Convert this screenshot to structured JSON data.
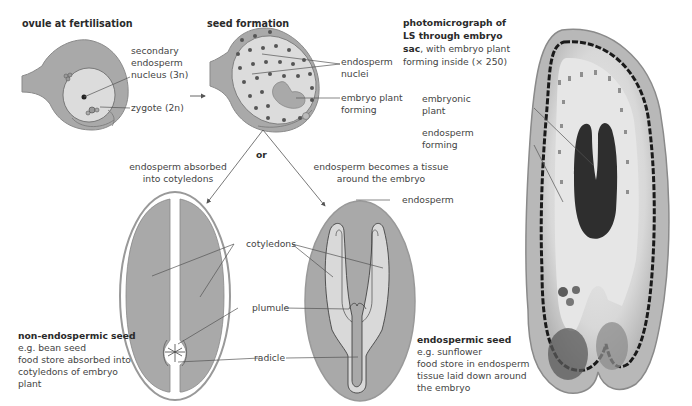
{
  "colors": {
    "seed_fill": "#a9a9a9",
    "light_fill": "#d9d9d9",
    "outline": "#8a8a8a",
    "line": "#555555",
    "text": "#444444"
  },
  "panels": {
    "ovule": {
      "title": "ovule at fertilisation",
      "labels": {
        "secondary_nucleus": [
          "secondary",
          "endosperm",
          "nucleus (3n)"
        ],
        "zygote": "zygote (2n)"
      }
    },
    "seed_formation": {
      "title": "seed formation",
      "labels": {
        "endosperm_nuclei": [
          "endosperm",
          "nuclei"
        ],
        "embryo_plant_forming": [
          "embryo plant",
          "forming"
        ]
      },
      "branch_word": "or"
    },
    "photomicrograph": {
      "title_line1": "photomicrograph of",
      "title_line2": "LS through embryo",
      "title_line3_bold": "sac",
      "title_line3_rest": ", with embryo plant",
      "title_line4": "forming inside (× 250)",
      "labels": {
        "embryonic_plant": [
          "embryonic",
          "plant"
        ],
        "endosperm_forming": [
          "endosperm",
          "forming"
        ]
      }
    },
    "non_endospermic": {
      "caption": [
        "endosperm absorbed",
        "into cotyledons"
      ],
      "heading": "non-endospermic seed",
      "description": [
        "e.g. bean seed",
        "food store absorbed into",
        "cotyledons of embryo",
        "plant"
      ]
    },
    "endospermic": {
      "caption": [
        "endosperm becomes a tissue",
        "around the embryo"
      ],
      "heading": "endospermic seed",
      "description": [
        "e.g. sunflower",
        "food store in endosperm",
        "tissue laid down around",
        "the embryo"
      ],
      "labels": {
        "endosperm": "endosperm"
      }
    },
    "shared_labels": {
      "cotyledons": "cotyledons",
      "plumule": "plumule",
      "radicle": "radicle"
    }
  }
}
